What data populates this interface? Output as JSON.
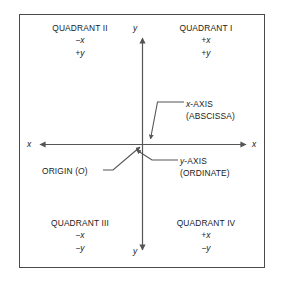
{
  "figure": {
    "frame_color": "#4a4a4a",
    "line_color": "#555555",
    "text_color": "#1a1a1a",
    "background": "#ffffff"
  },
  "quadrants": [
    {
      "name": "QUADRANT I",
      "x_sign": "+x",
      "y_sign": "+y"
    },
    {
      "name": "QUADRANT II",
      "x_sign": "−x",
      "y_sign": "+y"
    },
    {
      "name": "QUADRANT III",
      "x_sign": "−x",
      "y_sign": "−y"
    },
    {
      "name": "QUADRANT IV",
      "x_sign": "+x",
      "y_sign": "−y"
    }
  ],
  "axis_end_labels": {
    "x_left": "x",
    "x_right": "x",
    "y_top": "y",
    "y_bottom": "y"
  },
  "callouts": {
    "x_axis": {
      "line1_italic": "x",
      "line1_rest": "-AXIS",
      "line2": "(ABSCISSA)"
    },
    "y_axis": {
      "line1_italic": "y",
      "line1_rest": "-AXIS",
      "line2": "(ORDINATE)"
    },
    "origin": {
      "text_before": "ORIGIN (",
      "italic": "O",
      "text_after": ")"
    }
  }
}
